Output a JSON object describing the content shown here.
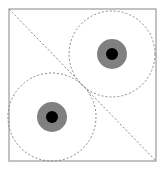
{
  "diagram": {
    "frame": {
      "x": 9,
      "y": 9,
      "width": 147,
      "height": 152,
      "stroke": "#9a9a9a"
    },
    "diagonal": {
      "x1": 9,
      "y1": 9,
      "x2": 156,
      "y2": 161,
      "stroke": "#888888"
    },
    "circles": [
      {
        "cx": 112,
        "cy": 54,
        "r": 43,
        "ring_r": 15,
        "dot_r": 6
      },
      {
        "cx": 52,
        "cy": 117,
        "r": 44,
        "ring_r": 15,
        "dot_r": 6
      }
    ],
    "colors": {
      "ring": "#808080",
      "dot": "#000000",
      "dashed": "#888888"
    }
  }
}
